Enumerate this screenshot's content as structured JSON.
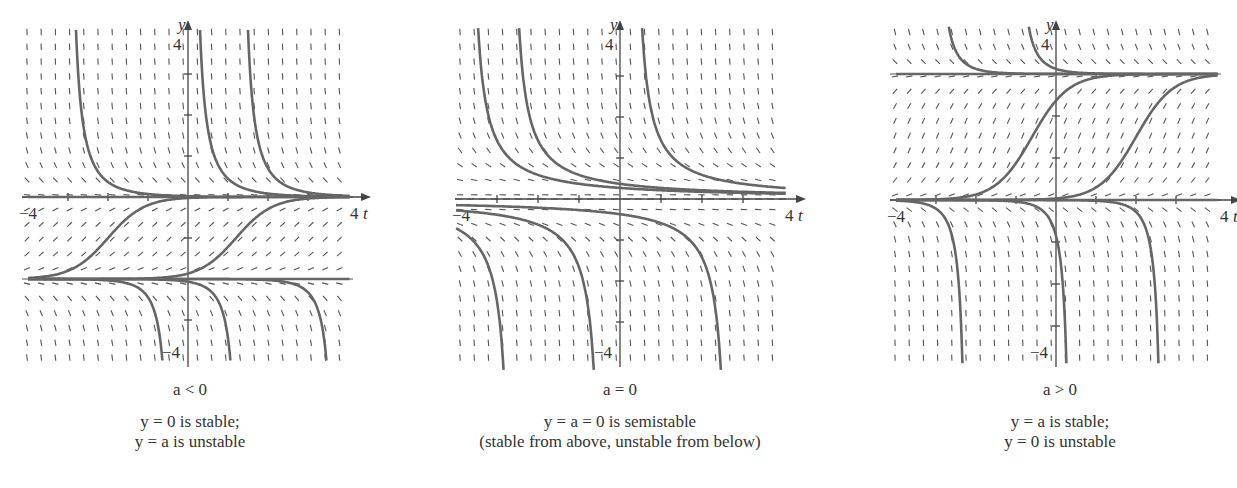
{
  "figure": {
    "equation_note": "Phase portraits / slope fields for dy/dt = y(y - a) style bifurcation example",
    "colors": {
      "curve": "#666666",
      "slope": "#555555",
      "axis": "#444444",
      "equilibrium": "#555555",
      "text": "#333333"
    }
  },
  "panels": [
    {
      "id": "a-negative",
      "condition": "a < 0",
      "caption_line1": "y = 0 is stable;",
      "caption_line2": "y = a is unstable",
      "axis_x_label": "t",
      "axis_y_label": "y",
      "tick_label_xmin": "−4",
      "tick_label_xmax": "4",
      "tick_label_ymax": "4",
      "tick_label_ymin": "−4",
      "a": -2
    },
    {
      "id": "a-zero",
      "condition": "a = 0",
      "caption_line1": "y = a = 0 is semistable",
      "caption_line2": "(stable from above, unstable from below)",
      "axis_x_label": "t",
      "axis_y_label": "y",
      "tick_label_xmin": "−4",
      "tick_label_xmax": "4",
      "tick_label_ymax": "4",
      "tick_label_ymin": "−4",
      "a": 0
    },
    {
      "id": "a-positive",
      "condition": "a > 0",
      "caption_line1": "y = a is stable;",
      "caption_line2": "y = 0 is unstable",
      "axis_x_label": "t",
      "axis_y_label": "y",
      "tick_label_xmin": "−4",
      "tick_label_xmax": "4",
      "tick_label_ymax": "4",
      "tick_label_ymin": "−4",
      "a": 3
    }
  ],
  "chart_data": [
    {
      "type": "line",
      "title": "a < 0",
      "xlabel": "t",
      "ylabel": "y",
      "xlim": [
        -4,
        4
      ],
      "ylim": [
        -4,
        4
      ],
      "grid": false,
      "slope_field": true,
      "equilibria": [
        {
          "y": 0,
          "stability": "stable"
        },
        {
          "y": -2,
          "stability": "unstable"
        }
      ],
      "series": [
        {
          "name": "solution above 0 (t0=-3)",
          "kind": "decay-to-0",
          "t0": -3
        },
        {
          "name": "solution above 0 (t0=0.1)",
          "kind": "decay-to-0",
          "t0": 0.1
        },
        {
          "name": "solution above 0 (t0=1.3)",
          "kind": "decay-to-0",
          "t0": 1.3
        },
        {
          "name": "S-curve from a to 0 (center -2)",
          "kind": "rise-a-to-0",
          "center": -2
        },
        {
          "name": "S-curve from a to 0 (center 1.2)",
          "kind": "rise-a-to-0",
          "center": 1.2
        },
        {
          "name": "equilibrium y=a",
          "kind": "const",
          "y": -2
        },
        {
          "name": "equilibrium y=0",
          "kind": "const",
          "y": 0
        },
        {
          "name": "blowup below a (t*=-0.4)",
          "kind": "fall-below-a",
          "blowup": -0.4
        },
        {
          "name": "blowup below a (t*=1.3)",
          "kind": "fall-below-a",
          "blowup": 1.3
        },
        {
          "name": "blowup below a (t*=3.7)",
          "kind": "fall-below-a",
          "blowup": 3.7
        }
      ]
    },
    {
      "type": "line",
      "title": "a = 0",
      "xlabel": "t",
      "ylabel": "y",
      "xlim": [
        -4,
        4
      ],
      "ylim": [
        -4,
        4
      ],
      "grid": false,
      "slope_field": true,
      "equilibria": [
        {
          "y": 0,
          "stability": "semistable"
        }
      ],
      "series": [
        {
          "name": "above 0 (pole t=-3.7)",
          "kind": "hyper-above",
          "pole": -3.7
        },
        {
          "name": "above 0 (pole t=-2.7)",
          "kind": "hyper-above",
          "pole": -2.7
        },
        {
          "name": "above 0 (pole t=0.3)",
          "kind": "hyper-above",
          "pole": 0.3
        },
        {
          "name": "below 0 (pole t=-2.6)",
          "kind": "hyper-below",
          "pole": -2.6
        },
        {
          "name": "below 0 (pole t=-0.4)",
          "kind": "hyper-below",
          "pole": -0.4
        },
        {
          "name": "below 0 (pole t=2.7)",
          "kind": "hyper-below",
          "pole": 2.7
        }
      ]
    },
    {
      "type": "line",
      "title": "a > 0",
      "xlabel": "t",
      "ylabel": "y",
      "xlim": [
        -4,
        4
      ],
      "ylim": [
        -4,
        4
      ],
      "grid": false,
      "slope_field": true,
      "equilibria": [
        {
          "y": 3,
          "stability": "stable"
        },
        {
          "y": 0,
          "stability": "unstable"
        }
      ],
      "series": [
        {
          "name": "above a (t0=-3)",
          "kind": "decay-to-a",
          "t0": -3
        },
        {
          "name": "above a (t0=-1)",
          "kind": "decay-to-a",
          "t0": -1
        },
        {
          "name": "S-curve 0 to a (center -0.6)",
          "kind": "rise-0-to-a",
          "center": -0.6
        },
        {
          "name": "S-curve 0 to a (center 2)",
          "kind": "rise-0-to-a",
          "center": 2
        },
        {
          "name": "equilibrium y=a",
          "kind": "const",
          "y": 3
        },
        {
          "name": "equilibrium y=0",
          "kind": "const",
          "y": 0
        },
        {
          "name": "blowup below 0 (t*=-2.2)",
          "kind": "fall-below-0",
          "blowup": -2.2
        },
        {
          "name": "blowup below 0 (t*=0.4)",
          "kind": "fall-below-0",
          "blowup": 0.4
        },
        {
          "name": "blowup below 0 (t*=2.7)",
          "kind": "fall-below-0",
          "blowup": 2.7
        }
      ]
    }
  ]
}
